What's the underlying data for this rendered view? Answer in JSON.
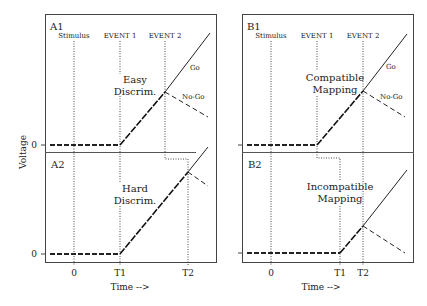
{
  "figure": {
    "y_axis_label": "Voltage",
    "x_axis_label": "Time -->",
    "zero_label": "0"
  },
  "panels": {
    "A1": {
      "label": "A1",
      "condition_line1": "Easy",
      "condition_line2": "Discrim.",
      "events": [
        "Stimulus",
        "EVENT 1",
        "EVENT 2"
      ],
      "curve_labels": {
        "go": "Go",
        "nogo": "No-Go"
      }
    },
    "A2": {
      "label": "A2",
      "condition_line1": "Hard",
      "condition_line2": "Discrim."
    },
    "B1": {
      "label": "B1",
      "condition_line1": "Compatible",
      "condition_line2": "Mapping",
      "events": [
        "Stimulus",
        "EVENT 1",
        "EVENT 2"
      ],
      "curve_labels": {
        "go": "Go",
        "nogo": "No-Go"
      }
    },
    "B2": {
      "label": "B2",
      "condition_line1": "Incompatible",
      "condition_line2": "Mapping"
    }
  },
  "time_ticks": {
    "left": [
      "0",
      "T1",
      "T2"
    ],
    "right": [
      "0",
      "T1",
      "T2"
    ]
  }
}
